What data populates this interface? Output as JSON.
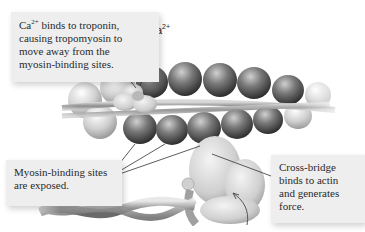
{
  "callouts": {
    "calcium_troponin": {
      "lines": [
        "Ca",
        "2+",
        " binds to troponin,",
        "causing tropomyosin to",
        "move away from the",
        "myosin-binding sites."
      ]
    },
    "binding_sites": {
      "lines": [
        "Myosin-binding sites",
        "are exposed."
      ]
    },
    "cross_bridge": {
      "lines": [
        "Cross-bridge",
        "binds to actin",
        "and generates",
        "force."
      ]
    }
  },
  "labels": {
    "calcium": {
      "base": "Ca",
      "sup": "2+"
    }
  },
  "colors": {
    "callout_bg": "#eeeeee",
    "text": "#2a2a2a",
    "actin_dark": "#4a4a4a",
    "actin_light": "#bdbdbd",
    "myosin": "#d9d9d9",
    "leader_line": "#333333"
  }
}
